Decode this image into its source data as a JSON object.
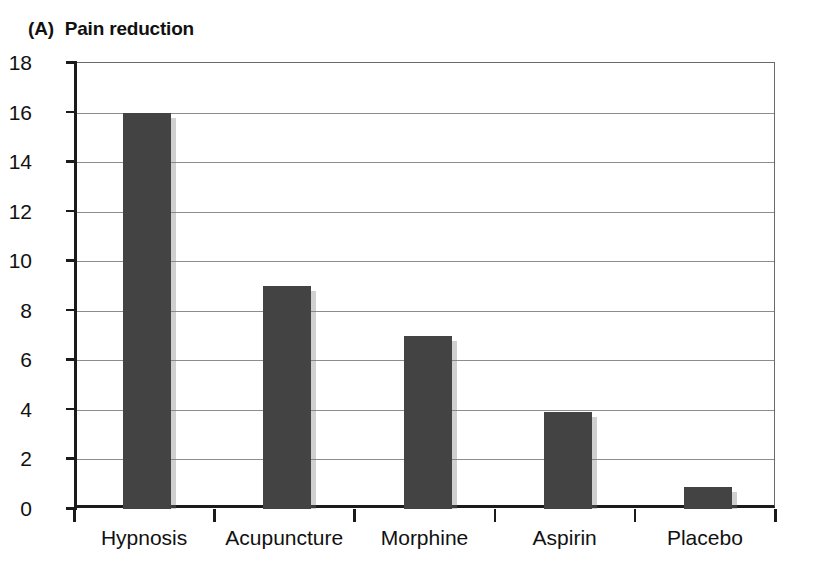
{
  "figure": {
    "panel_label": "(A)",
    "title": "Pain reduction"
  },
  "chart_data": {
    "type": "bar",
    "title": "(A) Pain reduction",
    "categories": [
      "Hypnosis",
      "Acupuncture",
      "Morphine",
      "Aspirin",
      "Placebo"
    ],
    "values": [
      16,
      9,
      7,
      3.9,
      0.9
    ],
    "xlabel": "",
    "ylabel": "",
    "ylim": [
      0,
      18
    ],
    "yticks": [
      0,
      2,
      4,
      6,
      8,
      10,
      12,
      14,
      16,
      18
    ],
    "ytick_labels": [
      "0",
      "2",
      "4",
      "6",
      "8",
      "10",
      "12",
      "14",
      "16",
      "18"
    ],
    "grid": true,
    "grid_axis": "y",
    "legend": false,
    "bar_color": "#434343",
    "axis_color": "#1b1b1b",
    "grid_color": "#8d8d8d"
  }
}
